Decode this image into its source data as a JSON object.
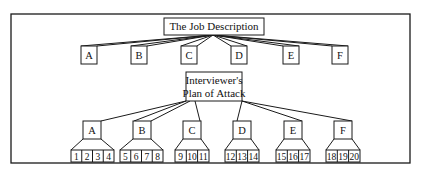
{
  "diagram": {
    "top": {
      "title": "The Job Description",
      "children": [
        "A",
        "B",
        "C",
        "D",
        "E",
        "F"
      ]
    },
    "bottom": {
      "title_line1": "Interviewer's",
      "title_line2": "Plan of Attack",
      "groups": [
        {
          "label": "A",
          "items": [
            "1",
            "2",
            "3",
            "4"
          ]
        },
        {
          "label": "B",
          "items": [
            "5",
            "6",
            "7",
            "8"
          ]
        },
        {
          "label": "C",
          "items": [
            "9",
            "10",
            "11"
          ]
        },
        {
          "label": "D",
          "items": [
            "12",
            "13",
            "14"
          ]
        },
        {
          "label": "E",
          "items": [
            "15",
            "16",
            "17"
          ]
        },
        {
          "label": "F",
          "items": [
            "18",
            "19",
            "20"
          ]
        }
      ]
    },
    "colors": {
      "line": "#1a1a1a",
      "background": "#ffffff"
    }
  }
}
